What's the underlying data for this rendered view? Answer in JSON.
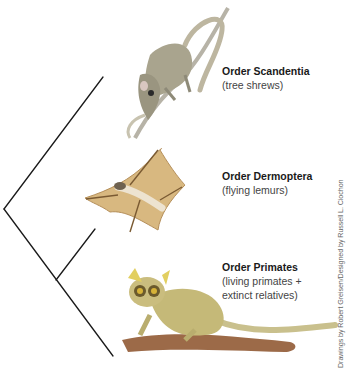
{
  "figure": {
    "type": "phylogenetic-tree",
    "taxa": [
      {
        "id": "scandentia",
        "title": "Order Scandentia",
        "subtitle_lines": [
          "(tree shrews)"
        ],
        "illustration": "tree shrew climbing branch"
      },
      {
        "id": "dermoptera",
        "title": "Order Dermoptera",
        "subtitle_lines": [
          "(flying lemurs)"
        ],
        "illustration": "flying lemur gliding"
      },
      {
        "id": "primates",
        "title": "Order Primates",
        "subtitle_lines": [
          "(living primates +",
          "extinct relatives)"
        ],
        "illustration": "bushbaby on branch"
      }
    ],
    "tree": {
      "line_color": "#1a1a1a",
      "root": [
        4,
        209
      ],
      "tips": {
        "scandentia": [
          103,
          77
        ],
        "dermoptera": [
          95,
          229
        ],
        "primates": [
          113,
          356
        ]
      },
      "internal_node": [
        56,
        280
      ]
    },
    "credit": "Drawings by Robert Greisen/Designed by Russell L. Ciochon"
  },
  "colors": {
    "shrew_fur": "#a9a48e",
    "lemur_membrane": "#d8b880",
    "galago_fur": "#c5b978",
    "branch": "#9c6a48"
  }
}
